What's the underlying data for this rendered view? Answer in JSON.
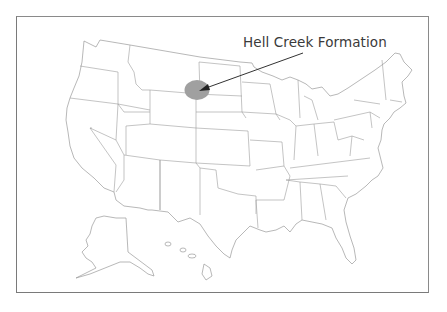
{
  "figure": {
    "type": "map",
    "region": "United States (contiguous, with Alaska and Hawaii insets)",
    "annotation": {
      "label": "Hell Creek Formation",
      "marker_color": "#a0a0a0",
      "arrow_color": "#333333",
      "marker_location": "northeastern Montana / western Dakotas"
    },
    "colors": {
      "border": "#8a8a8a",
      "state_lines": "#9c9c9c",
      "background": "#ffffff",
      "text": "#3a3a3a"
    }
  }
}
